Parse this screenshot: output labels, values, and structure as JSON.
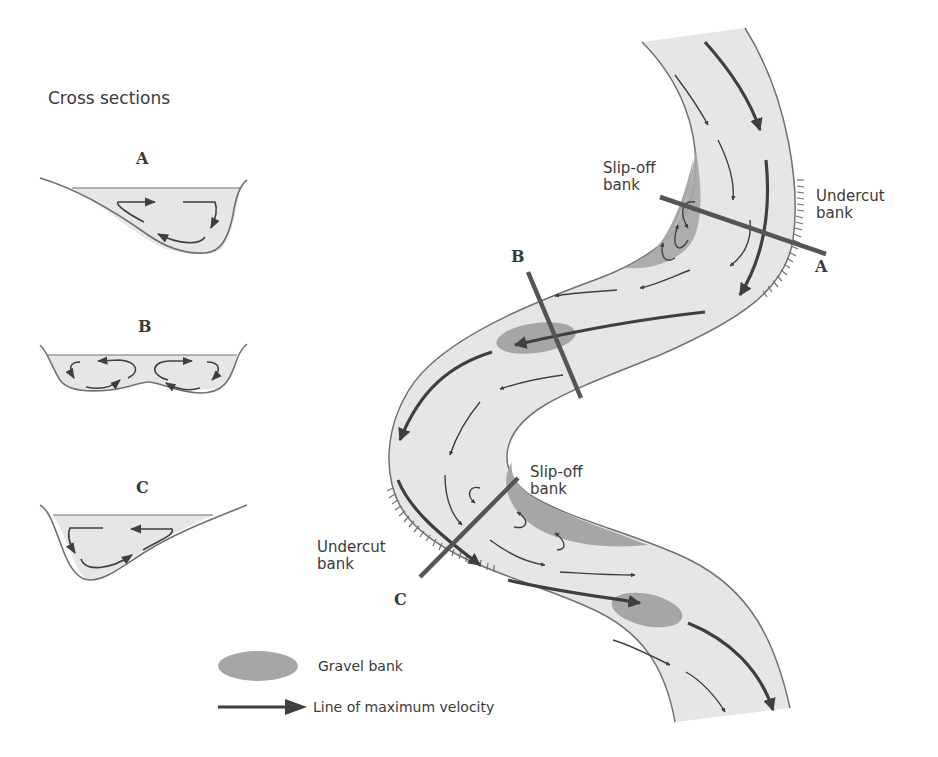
{
  "diagram": {
    "type": "river meander flow diagram",
    "colors": {
      "water": "#e6e6e6",
      "bank_line": "#707070",
      "gravel": "#a6a6a6",
      "arrow": "#3f3f3f",
      "section_line": "#555555",
      "text": "#3a3a3a"
    }
  },
  "cross_sections": {
    "title": "Cross sections",
    "items": [
      {
        "letter": "A",
        "shape": "asymmetric, deep on right (undercut) side",
        "cells": 1
      },
      {
        "letter": "B",
        "shape": "symmetric, two circulation cells",
        "cells": 2
      },
      {
        "letter": "C",
        "shape": "asymmetric, deep on left (undercut) side",
        "cells": 1
      }
    ]
  },
  "river": {
    "section_lines": [
      {
        "letter": "A",
        "label_inner": "Slip-off\nbank",
        "label_inner_line1": "Slip-off",
        "label_inner_line2": "bank",
        "label_outer_line1": "Undercut",
        "label_outer_line2": "bank"
      },
      {
        "letter": "B"
      },
      {
        "letter": "C",
        "label_inner_line1": "Slip-off",
        "label_inner_line2": "bank",
        "label_outer_line1": "Undercut",
        "label_outer_line2": "bank"
      }
    ]
  },
  "legend": {
    "items": [
      {
        "symbol": "gravel-ellipse",
        "label": "Gravel bank"
      },
      {
        "symbol": "thick-arrow",
        "label": "Line of maximum velocity"
      }
    ]
  }
}
